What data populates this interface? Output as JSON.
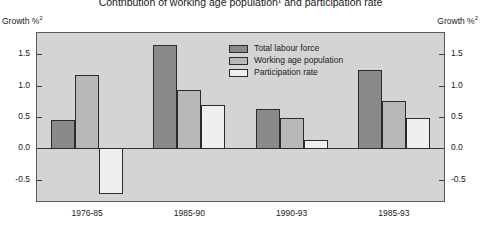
{
  "chart_data": {
    "type": "bar",
    "title": "Contribution of working age population¹ and participation rate",
    "title_footnote": "1",
    "ylabel_left": "Growth %",
    "ylabel_left_footnote": "2",
    "ylabel_right": "Growth %",
    "ylabel_right_footnote": "2",
    "xlabel": "",
    "categories": [
      "1976-85",
      "1985-90",
      "1990-93",
      "1985-93"
    ],
    "series": [
      {
        "name": "Total labour force",
        "color": "#8a8a8a",
        "values": [
          0.46,
          1.65,
          0.63,
          1.24
        ]
      },
      {
        "name": "Working age population",
        "color": "#b8b8b8",
        "values": [
          1.17,
          0.93,
          0.48,
          0.76
        ]
      },
      {
        "name": "Participation rate",
        "color": "#efefef",
        "values": [
          -0.7,
          0.69,
          0.14,
          0.48
        ]
      }
    ],
    "ylim": [
      -0.85,
      1.85
    ],
    "yticks": [
      1.5,
      1.0,
      0.5,
      0.0,
      -0.5
    ],
    "ytick_labels": [
      "1.5",
      "1.0",
      "0.5",
      "0.0",
      "-0.5"
    ],
    "grid": false,
    "legend_position": "inside-top-center",
    "plot_background": "#d4d4d4",
    "axis_color": "#5a5a5a",
    "bar_border_color": "#2b2b2b"
  }
}
